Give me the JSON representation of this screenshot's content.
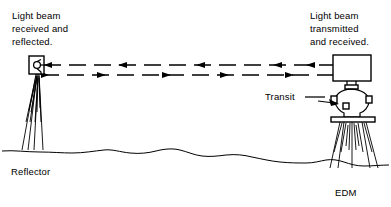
{
  "diagram": {
    "background_color": "#ffffff",
    "ink_color": "#000000",
    "labels": {
      "left_caption_line1": "Light beam",
      "left_caption_line2": "received and",
      "left_caption_line3": "reflected.",
      "right_caption_line1": "Light beam",
      "right_caption_line2": "transmitted",
      "right_caption_line3": "and received.",
      "transit": "Transit",
      "reflector": "Reflector",
      "edm": "EDM"
    },
    "beams": [
      {
        "name": "return-beam",
        "direction": "right-to-left",
        "style": "dashed",
        "description": "Beam reflected from reflector back to EDM",
        "arrow_count": 4
      },
      {
        "name": "transmitted-beam",
        "direction": "left-to-right",
        "style": "dashed",
        "description": "Beam transmitted from EDM toward reflector",
        "arrow_count": 5
      }
    ],
    "instruments": [
      {
        "name": "reflector",
        "label": "Reflector",
        "side": "left",
        "parts": [
          "prism-head",
          "tripod"
        ]
      },
      {
        "name": "edm",
        "label": "EDM",
        "side": "right",
        "parts": [
          "edm-box",
          "transit-body",
          "tripod-head-plate",
          "tripod"
        ]
      }
    ],
    "ground": {
      "name": "ground-line",
      "style": "undulating-terrain"
    }
  }
}
